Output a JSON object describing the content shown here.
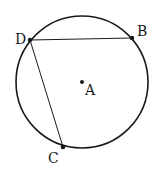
{
  "diagram": {
    "type": "circle-geometry",
    "circle": {
      "cx": 82,
      "cy": 82,
      "r": 66,
      "stroke": "#1a1a1a"
    },
    "points": [
      {
        "id": "A",
        "label": "A",
        "x": 82,
        "y": 82,
        "label_x": 85,
        "label_y": 95
      },
      {
        "id": "B",
        "label": "B",
        "x": 132,
        "y": 38,
        "label_x": 137,
        "label_y": 36
      },
      {
        "id": "C",
        "label": "C",
        "x": 63,
        "y": 147,
        "label_x": 48,
        "label_y": 163
      },
      {
        "id": "D",
        "label": "D",
        "x": 30,
        "y": 40,
        "label_x": 15,
        "label_y": 44
      }
    ],
    "segments": [
      {
        "from": "D",
        "to": "B"
      },
      {
        "from": "D",
        "to": "C"
      }
    ]
  }
}
